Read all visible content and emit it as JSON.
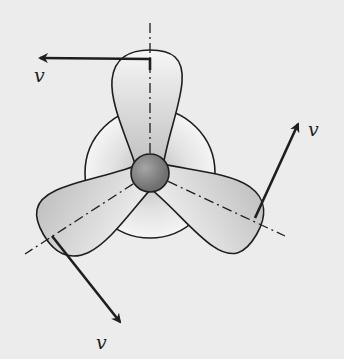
{
  "diagram": {
    "labels": {
      "top_velocity": "v",
      "right_velocity": "v",
      "bottom_velocity": "v"
    },
    "components": [
      "hub",
      "disc",
      "blade-top",
      "blade-lower-left",
      "blade-lower-right",
      "center-axes",
      "velocity-arrows"
    ],
    "colors": {
      "background": "#ececec",
      "stroke": "#1e1e1e",
      "blade_fill_light": "#f4f4f4",
      "blade_fill_dark": "#c8c8c8",
      "hub_fill": "#8a8a8a"
    }
  }
}
